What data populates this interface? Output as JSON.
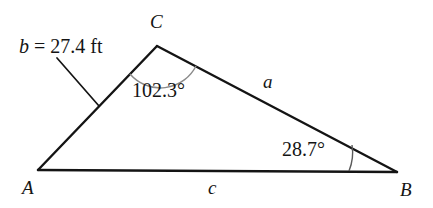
{
  "figure": {
    "type": "triangle-diagram",
    "background_color": "#ffffff",
    "stroke_color": "#141414",
    "arc_color": "#777777",
    "vertices": [
      {
        "name": "A",
        "label": "A",
        "x": 38,
        "y": 170
      },
      {
        "name": "B",
        "label": "B",
        "x": 397,
        "y": 172
      },
      {
        "name": "C",
        "label": "C",
        "x": 157,
        "y": 46
      }
    ],
    "sides": [
      {
        "name": "a",
        "label": "a",
        "between": "C-B"
      },
      {
        "name": "b",
        "label": "b",
        "between": "A-C",
        "measure": "b = 27.4 ft",
        "value": 27.4,
        "unit": "ft"
      },
      {
        "name": "c",
        "label": "c",
        "between": "A-B"
      }
    ],
    "angles": [
      {
        "at": "C",
        "label": "102.3°",
        "value": 102.3,
        "unit": "degrees"
      },
      {
        "at": "B",
        "label": "28.7°",
        "value": 28.7,
        "unit": "degrees"
      }
    ],
    "measure_label": {
      "variable": "b",
      "rest": " = 27.4 ft",
      "full": "b = 27.4 ft"
    }
  }
}
